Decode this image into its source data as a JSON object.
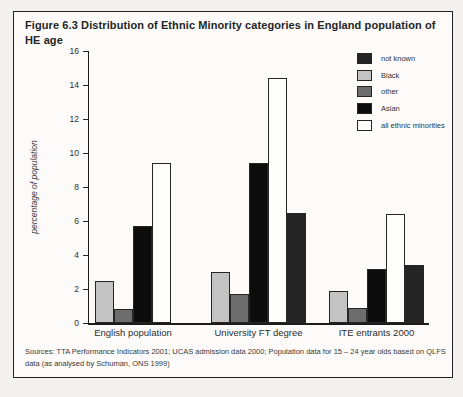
{
  "figure": {
    "title": "Figure 6.3 Distribution of Ethnic Minority categories in England population of HE age",
    "sources": "Sources: TTA Performance Indicators 2001; UCAS admission data 2000; Population data for 15 – 24 year olds based on QLFS data (as analysed by Schuman, ONS 1999)"
  },
  "chart_data": {
    "type": "bar",
    "title": "Figure 6.3 Distribution of Ethnic Minority categories in England population of HE age",
    "xlabel": "",
    "ylabel": "percentage of population",
    "ylim": [
      0,
      16
    ],
    "yticks": [
      0,
      2,
      4,
      6,
      8,
      10,
      12,
      14,
      16
    ],
    "grid": false,
    "legend_position": "top-right",
    "categories": [
      "English population",
      "University FT degree",
      "ITE entrants 2000"
    ],
    "bar_order": [
      "Black",
      "other",
      "Asian",
      "all ethnic minorities",
      "not known"
    ],
    "legend_order": [
      "not known",
      "Black",
      "other",
      "Asian",
      "all ethnic minorities"
    ],
    "series": [
      {
        "name": "not known",
        "color": "#242424",
        "values": [
          null,
          6.5,
          3.4
        ]
      },
      {
        "name": "Black",
        "color": "#c3c3c3",
        "values": [
          2.5,
          3.0,
          1.9
        ]
      },
      {
        "name": "other",
        "color": "#6d6d6d",
        "values": [
          0.8,
          1.7,
          0.9
        ]
      },
      {
        "name": "Asian",
        "color": "#0c0c0c",
        "values": [
          5.7,
          9.4,
          3.2
        ]
      },
      {
        "name": "all ethnic minorities",
        "color": "#fdfdfc",
        "values": [
          9.4,
          14.4,
          6.4
        ]
      }
    ]
  }
}
